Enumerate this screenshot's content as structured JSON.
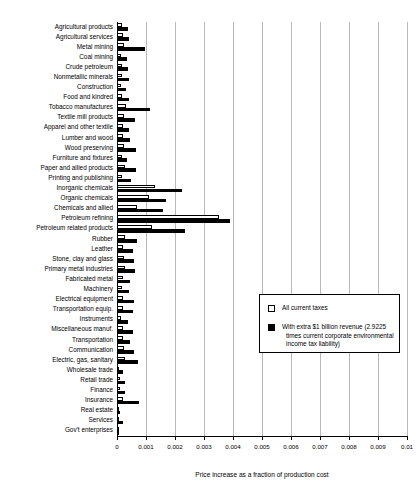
{
  "chart_data": {
    "type": "bar",
    "orientation": "horizontal",
    "title": "",
    "xlabel": "Price increase as a fraction of production cost",
    "ylabel": "",
    "xlim": [
      0,
      0.01
    ],
    "xticks": [
      "0",
      "0.001",
      "0.002",
      "0.003",
      "0.004",
      "0.005",
      "0.006",
      "0.007",
      "0.008",
      "0.009",
      "0.01"
    ],
    "grid": true,
    "legend_position": "center-right",
    "categories": [
      "Agricultural products",
      "Agricultural services",
      "Metal mining",
      "Coal mining",
      "Crude petroleum",
      "Nonmetallic minerals",
      "Construction",
      "Food and kindred",
      "Tobacco manufactures",
      "Textile mill products",
      "Apparel and other textile",
      "Lumber and wood",
      "Wood preserving",
      "Furniture and fixtures",
      "Paper and allied products",
      "Printing and publishing",
      "Inorganic chemicals",
      "Organic chemicals",
      "Chemicals and allied",
      "Petroleum refining",
      "Petroleum related products",
      "Rubber",
      "Leather",
      "Stone, clay and glass",
      "Primary metal industries",
      "Fabricated metal",
      "Machinery",
      "Electrical equipment",
      "Transportation equip.",
      "Instruments",
      "Miscellaneous manuf.",
      "Transportation",
      "Communication",
      "Electric, gas, sanitary",
      "Wholesale trade",
      "Retail trade",
      "Finance",
      "Insurance",
      "Real estate",
      "Services",
      "Gov't enterprises"
    ],
    "series": [
      {
        "name": "All current taxes",
        "color": "#ffffff",
        "edgecolor": "#000000",
        "values": [
          0.00016,
          0.00022,
          0.00025,
          0.00014,
          0.00016,
          0.00018,
          0.00013,
          0.00018,
          0.0003,
          0.00024,
          0.00019,
          0.0002,
          0.00025,
          0.00016,
          0.00026,
          0.00018,
          0.0013,
          0.00112,
          0.0007,
          0.0035,
          0.00122,
          0.00026,
          0.00022,
          0.00025,
          0.00026,
          0.00019,
          0.00016,
          0.00022,
          0.0002,
          0.00015,
          0.0002,
          0.00019,
          0.00023,
          0.00026,
          7e-05,
          0.0001,
          0.00012,
          0.0002,
          4e-05,
          8e-05,
          3e-05
        ]
      },
      {
        "name": "With extra $1 billion revenue (2.9225 times current corporate environmental income tax liability)",
        "color": "#000000",
        "values": [
          0.00038,
          0.00043,
          0.00098,
          0.00035,
          0.00038,
          0.00042,
          0.00032,
          0.00043,
          0.00115,
          0.00062,
          0.00043,
          0.00045,
          0.00065,
          0.00036,
          0.00066,
          0.00048,
          0.00225,
          0.0017,
          0.0016,
          0.0039,
          0.00235,
          0.00069,
          0.00056,
          0.0006,
          0.00063,
          0.00046,
          0.00043,
          0.0006,
          0.00054,
          0.00038,
          0.00055,
          0.00046,
          0.0006,
          0.00074,
          0.0002,
          0.00026,
          0.00029,
          0.00076,
          0.0001,
          0.00022,
          8e-05
        ]
      }
    ]
  },
  "legend": {
    "items": [
      {
        "label": "All current taxes",
        "swatch": "white-square"
      },
      {
        "line1": "With extra $1 billion revenue (2.9225",
        "line2": "times current corporate environmental",
        "line3": "income tax liability)",
        "swatch": "black-square"
      }
    ]
  }
}
